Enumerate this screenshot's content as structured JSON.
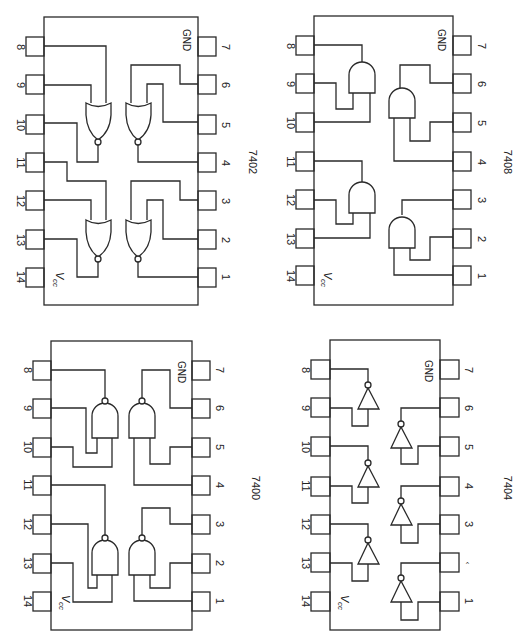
{
  "figure": {
    "orientation": "rotated-90-clockwise",
    "chips": [
      {
        "id": "7402",
        "label": "7402",
        "gate_type": "NOR",
        "gate_count": 4,
        "left_pins": [
          "8",
          "9",
          "10",
          "11",
          "12",
          "13",
          "14"
        ],
        "right_pins": [
          "7",
          "6",
          "5",
          "4",
          "3",
          "2",
          "1"
        ],
        "gnd_label": "GND",
        "vcc_label": "V",
        "vcc_sub": "cc"
      },
      {
        "id": "7408",
        "label": "7408",
        "gate_type": "AND",
        "gate_count": 4,
        "left_pins": [
          "8",
          "9",
          "10",
          "11",
          "12",
          "13",
          "14"
        ],
        "right_pins": [
          "7",
          "6",
          "5",
          "4",
          "3",
          "2",
          "1"
        ],
        "gnd_label": "GND",
        "vcc_label": "V",
        "vcc_sub": "cc"
      },
      {
        "id": "7400",
        "label": "7400",
        "gate_type": "NAND",
        "gate_count": 4,
        "left_pins": [
          "8",
          "9",
          "10",
          "11",
          "12",
          "13",
          "14"
        ],
        "right_pins": [
          "7",
          "6",
          "5",
          "4",
          "3",
          "2",
          "1"
        ],
        "gnd_label": "GND",
        "vcc_label": "V",
        "vcc_sub": "cc"
      },
      {
        "id": "7404",
        "label": "7404",
        "gate_type": "NOT",
        "gate_count": 6,
        "left_pins": [
          "8",
          "9",
          "10",
          "11",
          "12",
          "13",
          "14"
        ],
        "right_pins": [
          "7",
          "6",
          "5",
          "4",
          "3",
          "‹",
          "1"
        ],
        "gnd_label": "GND",
        "vcc_label": "V",
        "vcc_sub": "cc"
      }
    ],
    "colors": {
      "ink": "#2a2a2a",
      "background": "#ffffff"
    }
  }
}
